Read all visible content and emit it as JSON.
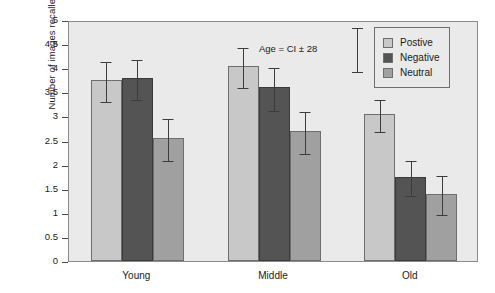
{
  "chart_data": {
    "type": "bar",
    "title": "",
    "xlabel": "",
    "ylabel": "Number of images recalled",
    "ylim": [
      0,
      5
    ],
    "ytick_step": 0.5,
    "yticks": [
      "5",
      "4.5",
      "4",
      "3.5",
      "3",
      "2.5",
      "2",
      "1.5",
      "1",
      "0.5",
      "0"
    ],
    "grid": false,
    "categories": [
      "Young",
      "Middle",
      "Old"
    ],
    "legend_position": "top-right",
    "series": [
      {
        "name": "Postive",
        "color": "#c8c8c8",
        "values": [
          3.75,
          4.05,
          3.05
        ],
        "errors": [
          0.42,
          0.42,
          0.33
        ]
      },
      {
        "name": "Negative",
        "color": "#545454",
        "values": [
          3.8,
          3.6,
          1.75
        ],
        "errors": [
          0.42,
          0.45,
          0.37
        ]
      },
      {
        "name": "Neutral",
        "color": "#a0a0a0",
        "values": [
          2.55,
          2.7,
          1.4
        ],
        "errors": [
          0.44,
          0.43,
          0.4
        ]
      }
    ],
    "annotations": [
      {
        "text": "Age = CI ± 28"
      }
    ]
  },
  "legend": {
    "items": [
      {
        "label": "Postive",
        "color": "#c8c8c8"
      },
      {
        "label": "Negative",
        "color": "#545454"
      },
      {
        "label": "Neutral",
        "color": "#a0a0a0"
      }
    ]
  },
  "colors": {
    "positive": "#c8c8c8",
    "negative": "#545454",
    "neutral": "#a0a0a0",
    "plot_background": "#eaeaea",
    "axis": "#4a4a4a",
    "text": "#1a1a1a"
  }
}
